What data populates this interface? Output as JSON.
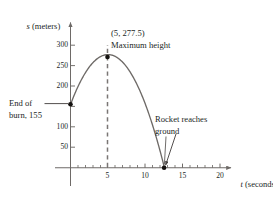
{
  "chart_data": {
    "type": "line",
    "title": "",
    "subtitle": "",
    "xlabel": "t (seconds)",
    "ylabel": "s (meters)",
    "xlabel_italic_part": "t",
    "xlabel_rest": " (seconds)",
    "ylabel_italic_part": "s",
    "ylabel_rest": " (meters)",
    "xlim": [
      -1.2,
      22.5
    ],
    "ylim": [
      -55,
      330
    ],
    "grid": false,
    "legend": null,
    "x_major_ticks": [
      5,
      10,
      15,
      20
    ],
    "x_major_tick_labels": [
      "5",
      "10",
      "15",
      "20"
    ],
    "x_minor_tick_step": 1,
    "x_minor_tick_range": [
      1,
      21
    ],
    "y_major_ticks": [
      50,
      100,
      150,
      200,
      250,
      300
    ],
    "y_major_tick_labels": [
      "50",
      "100",
      "150",
      "200",
      "250",
      "300"
    ],
    "y_tick_labels_shown": [
      "50",
      "100",
      "200",
      "250",
      "300"
    ],
    "series": [
      {
        "name": "rocket height",
        "type": "parabola",
        "equation": "s(t) = 155 + 49t - 4.9t^2",
        "t_start": 0,
        "t_end": 12.554,
        "points": [
          {
            "t": 0,
            "s": 155
          },
          {
            "t": 1,
            "s": 199.1
          },
          {
            "t": 2,
            "s": 233.4
          },
          {
            "t": 3,
            "s": 257.9
          },
          {
            "t": 4,
            "s": 272.6
          },
          {
            "t": 5,
            "s": 277.5
          },
          {
            "t": 6,
            "s": 272.6
          },
          {
            "t": 7,
            "s": 257.9
          },
          {
            "t": 8,
            "s": 233.4
          },
          {
            "t": 9,
            "s": 199.1
          },
          {
            "t": 10,
            "s": 155
          },
          {
            "t": 11,
            "s": 101.1
          },
          {
            "t": 12,
            "s": 37.4
          },
          {
            "t": 12.554,
            "s": 0
          }
        ]
      }
    ],
    "markers": [
      {
        "name": "end-of-burn",
        "t": 0,
        "s": 155,
        "label": "End of burn, 155"
      },
      {
        "name": "maximum-height",
        "t": 5,
        "s": 277.5,
        "label": "(5, 277.5)"
      },
      {
        "name": "rocket-reaches-ground",
        "t": 12.554,
        "s": 0,
        "label": "Rocket reaches ground"
      }
    ],
    "dashed_guides": [
      {
        "name": "vertical-at-max",
        "t": 5,
        "from_s": 0,
        "to_s": 300
      }
    ],
    "annotations": [
      {
        "name": "end-of-burn-annotation",
        "line1": "End of",
        "line2": "burn, 155",
        "leader": "line"
      },
      {
        "name": "maximum-height-annotation",
        "line1": "(5, 277.5)",
        "line2": "Maximum height",
        "leader": "none"
      },
      {
        "name": "rocket-ground-annotation",
        "line1": "Rocket reaches",
        "line2": "ground",
        "leader": "arrow"
      }
    ],
    "colors": {
      "background": "#ffffff",
      "curve": "#6e6a67",
      "axis": "#6e6a67",
      "dashed": "#7a7674",
      "marker": "#14110f",
      "text": "#211f1e",
      "leader": "#4a4644"
    }
  },
  "axes": {
    "y_axis_label": "s (meters)",
    "x_axis_label": "t (seconds)"
  },
  "ticks": {
    "y": [
      "300",
      "250",
      "200",
      "100",
      "50"
    ],
    "x": [
      "5",
      "10",
      "15",
      "20"
    ]
  },
  "annotations": {
    "max_point": "(5, 277.5)",
    "max_text": "Maximum height",
    "burn_line1": "End of",
    "burn_line2": "burn, 155",
    "ground_line1": "Rocket reaches",
    "ground_line2": "ground"
  }
}
